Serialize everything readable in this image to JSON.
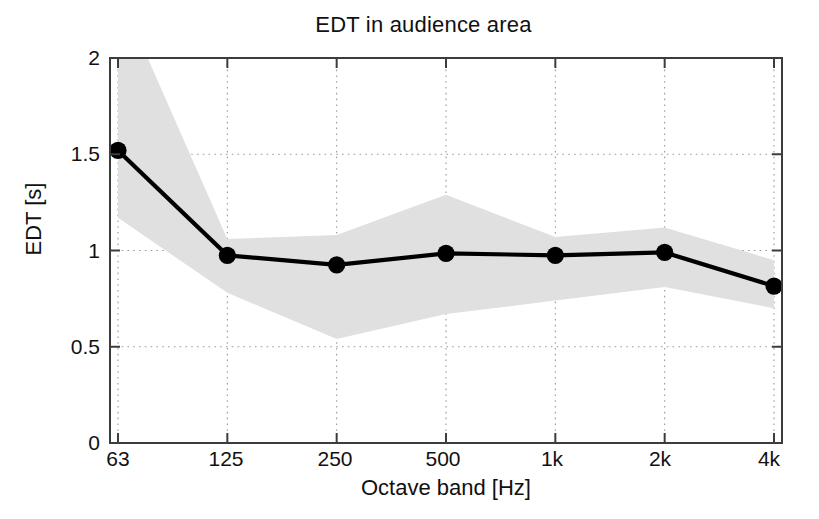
{
  "chart_data": {
    "type": "line",
    "title": "EDT in audience area",
    "xlabel": "Octave band [Hz]",
    "ylabel": "EDT [s]",
    "categories": [
      "63",
      "125",
      "250",
      "500",
      "1k",
      "2k",
      "4k"
    ],
    "values": [
      1.52,
      0.975,
      0.925,
      0.985,
      0.975,
      0.99,
      0.815
    ],
    "band_upper": [
      2.35,
      1.06,
      1.08,
      1.29,
      1.07,
      1.12,
      0.95
    ],
    "band_lower": [
      1.17,
      0.78,
      0.54,
      0.67,
      0.74,
      0.81,
      0.7
    ],
    "series": [
      {
        "name": "EDT mean",
        "values": [
          1.52,
          0.975,
          0.925,
          0.985,
          0.975,
          0.99,
          0.815
        ]
      }
    ],
    "ylim": [
      0,
      2
    ],
    "yticks": [
      0,
      0.5,
      1,
      1.5,
      2
    ],
    "ytick_labels": [
      "0",
      "0.5",
      "1",
      "1.5",
      "2"
    ],
    "xtick_labels": [
      "63",
      "125",
      "250",
      "500",
      "1k",
      "2k",
      "4k"
    ],
    "grid": true,
    "grid_style": "dotted",
    "legend": "none",
    "line_color": "#000000",
    "marker": "circle",
    "marker_color": "#000000",
    "band_color": "#e0e0e0",
    "axis_color": "#3a3a3a",
    "background_color": "#ffffff"
  }
}
